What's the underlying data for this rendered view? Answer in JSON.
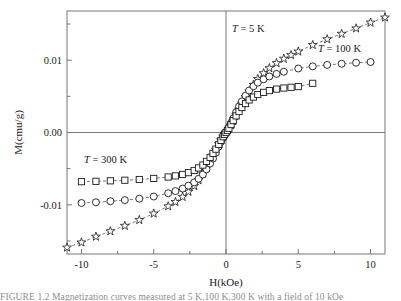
{
  "figure": {
    "axis_labels": {
      "x": "H(kOe)",
      "y": "M(cmu/g)"
    },
    "x_ticks": [
      "-10",
      "-5",
      "0",
      "5",
      "10"
    ],
    "y_ticks": [
      "0.01",
      "0.00",
      "-0.01"
    ],
    "series_labels": {
      "s5": {
        "t": "T",
        "rest": " = 5 K"
      },
      "s100": {
        "t": "T",
        "rest": " = 100 K"
      },
      "s300": {
        "t": "T",
        "rest": " = 300 K"
      }
    },
    "caption_fragment": "FIGURE 1.2  Magnetization curves measured at 5 K,100 K,300 K  with  a  field  of  10 kOe"
  },
  "chart_data": {
    "type": "scatter",
    "title": "",
    "xlabel": "H(kOe)",
    "ylabel": "M(cmu/g)",
    "xlim": [
      -11.0,
      11.0
    ],
    "ylim": [
      -0.0168,
      0.0168
    ],
    "grid": false,
    "zero_lines": true,
    "legend_position": "in-plot annotations",
    "series": [
      {
        "name": "T = 5 K",
        "marker": "star",
        "linestyle": "dashed",
        "x": [
          -11.0,
          -10.0,
          -9.0,
          -8.0,
          -7.0,
          -6.0,
          -5.0,
          -4.0,
          -3.5,
          -3.0,
          -2.6,
          -2.2,
          -1.9,
          -1.6,
          -1.35,
          -1.1,
          -0.9,
          -0.7,
          -0.5,
          -0.35,
          -0.2,
          -0.1,
          0.0,
          0.1,
          0.2,
          0.35,
          0.5,
          0.7,
          0.9,
          1.1,
          1.35,
          1.6,
          1.9,
          2.2,
          2.6,
          3.0,
          3.5,
          4.0,
          4.5,
          5.0,
          6.0,
          7.0,
          8.0,
          9.0,
          10.0,
          11.0
        ],
        "y": [
          -0.0159,
          -0.0152,
          -0.0144,
          -0.01365,
          -0.0129,
          -0.0121,
          -0.0112,
          -0.0102,
          -0.0096,
          -0.0089,
          -0.0082,
          -0.0074,
          -0.0066,
          -0.0057,
          -0.0049,
          -0.004,
          -0.0032,
          -0.0024,
          -0.0016,
          -0.00105,
          -0.00055,
          -0.00025,
          0.0,
          0.00025,
          0.00055,
          0.00105,
          0.0016,
          0.0024,
          0.0032,
          0.004,
          0.0049,
          0.0057,
          0.0066,
          0.0074,
          0.0082,
          0.0089,
          0.0096,
          0.0102,
          0.0107,
          0.0112,
          0.0121,
          0.0129,
          0.01365,
          0.0144,
          0.0152,
          0.0159
        ]
      },
      {
        "name": "T = 100 K",
        "marker": "circle",
        "linestyle": "dashed",
        "x": [
          -10.0,
          -9.0,
          -8.0,
          -7.0,
          -6.0,
          -5.0,
          -4.0,
          -3.5,
          -3.0,
          -2.6,
          -2.2,
          -1.9,
          -1.6,
          -1.35,
          -1.1,
          -0.9,
          -0.7,
          -0.5,
          -0.35,
          -0.2,
          -0.1,
          0.0,
          0.1,
          0.2,
          0.35,
          0.5,
          0.7,
          0.9,
          1.1,
          1.35,
          1.6,
          1.9,
          2.2,
          2.6,
          3.0,
          3.5,
          4.0,
          5.0,
          6.0,
          7.0,
          8.0,
          9.0,
          10.0
        ],
        "y": [
          -0.00975,
          -0.00965,
          -0.0095,
          -0.00935,
          -0.00915,
          -0.00885,
          -0.0084,
          -0.0081,
          -0.00775,
          -0.00735,
          -0.0069,
          -0.0064,
          -0.0058,
          -0.0051,
          -0.0043,
          -0.0036,
          -0.0028,
          -0.00195,
          -0.0013,
          -0.0007,
          -0.00032,
          0.0,
          0.00032,
          0.0007,
          0.0013,
          0.00195,
          0.0028,
          0.0036,
          0.0043,
          0.0051,
          0.0058,
          0.0064,
          0.0069,
          0.00735,
          0.00775,
          0.0081,
          0.0084,
          0.00885,
          0.00915,
          0.00935,
          0.0095,
          0.00965,
          0.00975
        ]
      },
      {
        "name": "T = 300 K",
        "marker": "square",
        "linestyle": "dashed",
        "x": [
          -10.0,
          -9.0,
          -8.0,
          -7.0,
          -6.0,
          -5.0,
          -4.0,
          -3.5,
          -3.0,
          -2.6,
          -2.2,
          -1.9,
          -1.6,
          -1.35,
          -1.1,
          -0.9,
          -0.7,
          -0.5,
          -0.35,
          -0.2,
          -0.1,
          0.0,
          0.1,
          0.2,
          0.35,
          0.5,
          0.7,
          0.9,
          1.1,
          1.35,
          1.6,
          1.9,
          2.2,
          2.6,
          3.0,
          3.5,
          4.0,
          4.5,
          5.0,
          6.0
        ],
        "y": [
          -0.0068,
          -0.00675,
          -0.00668,
          -0.0066,
          -0.0065,
          -0.00635,
          -0.00615,
          -0.006,
          -0.0058,
          -0.00555,
          -0.00525,
          -0.0049,
          -0.0045,
          -0.004,
          -0.00345,
          -0.0029,
          -0.0023,
          -0.00165,
          -0.0011,
          -0.00058,
          -0.00027,
          0.0,
          0.00027,
          0.00058,
          0.0011,
          0.00165,
          0.0023,
          0.0029,
          0.00345,
          0.004,
          0.0045,
          0.0049,
          0.00525,
          0.00555,
          0.0058,
          0.006,
          0.00615,
          0.00625,
          0.00635,
          0.0068
        ]
      }
    ]
  }
}
